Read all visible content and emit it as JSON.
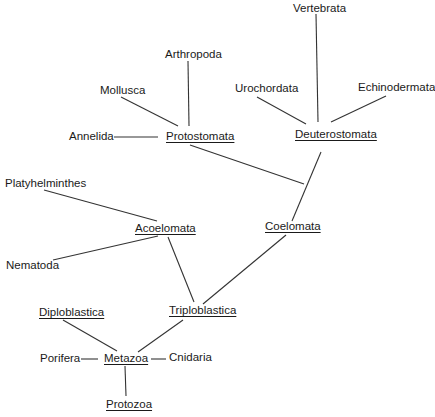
{
  "diagram": {
    "type": "phylogenetic-tree",
    "root": "Protozoa",
    "nodes": {
      "vertebrata": "Vertebrata",
      "arthropoda": "Arthropoda",
      "mollusca": "Mollusca",
      "urochordata": "Urochordata",
      "echinodermata": "Echinodermata",
      "annelida": "Annelida",
      "protostomata": "Protostomata",
      "deuterostomata": "Deuterostomata",
      "platyhelminthes": "Platyhelminthes",
      "acoelomata": "Acoelomata",
      "coelomata": "Coelomata",
      "nematoda": "Nematoda",
      "diploblastica": "Diploblastica",
      "triploblastica": "Triploblastica",
      "porifera": "Porifera",
      "metazoa": "Metazoa",
      "cnidaria": "Cnidaria",
      "protozoa": "Protozoa"
    },
    "underlined_groups": [
      "Protostomata",
      "Deuterostomata",
      "Acoelomata",
      "Coelomata",
      "Diploblastica",
      "Triploblastica",
      "Metazoa",
      "Protozoa"
    ],
    "edges": [
      [
        "Protozoa",
        "Metazoa"
      ],
      [
        "Metazoa",
        "Porifera"
      ],
      [
        "Metazoa",
        "Cnidaria"
      ],
      [
        "Metazoa",
        "Diploblastica"
      ],
      [
        "Metazoa",
        "Triploblastica"
      ],
      [
        "Triploblastica",
        "Acoelomata"
      ],
      [
        "Triploblastica",
        "Coelomata"
      ],
      [
        "Acoelomata",
        "Platyhelminthes"
      ],
      [
        "Acoelomata",
        "Nematoda"
      ],
      [
        "Coelomata",
        "Protostomata"
      ],
      [
        "Coelomata",
        "Deuterostomata"
      ],
      [
        "Protostomata",
        "Annelida"
      ],
      [
        "Protostomata",
        "Mollusca"
      ],
      [
        "Protostomata",
        "Arthropoda"
      ],
      [
        "Deuterostomata",
        "Urochordata"
      ],
      [
        "Deuterostomata",
        "Vertebrata"
      ],
      [
        "Deuterostomata",
        "Echinodermata"
      ]
    ],
    "line_color": "#333333"
  }
}
